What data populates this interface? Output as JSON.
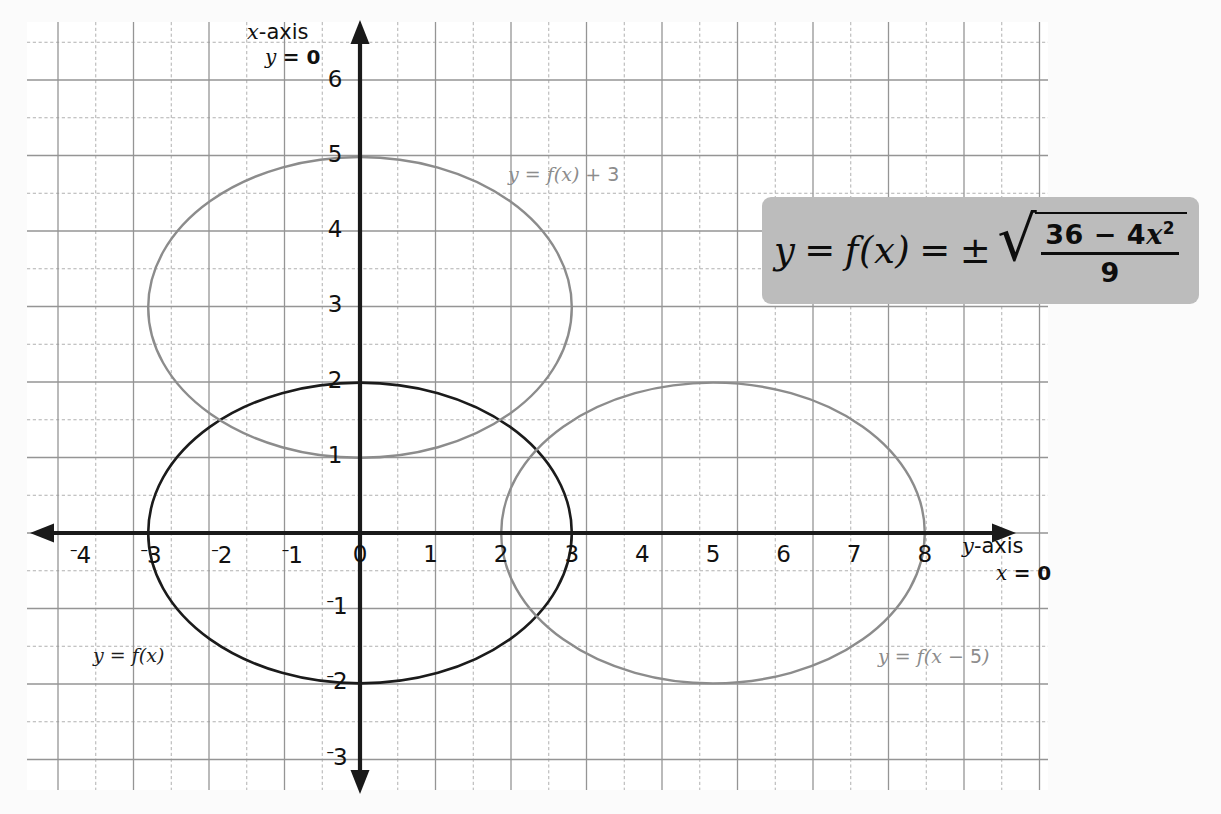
{
  "figure": {
    "background_color": "#fbfbfb",
    "grid": {
      "major_color": "#9a9a9a",
      "minor_color": "#b4b4b4",
      "left": 27,
      "top": 22,
      "right": 1048,
      "bottom": 790,
      "major_step": 75.5
    },
    "axes": {
      "origin_px": [
        360,
        533
      ],
      "unit_x_px": 70.6,
      "unit_y_px": 75.2,
      "color": "#1a1a1a",
      "vertical_label": "x-axis",
      "vertical_label_equation": "y = 0",
      "horizontal_label": "y-axis",
      "horizontal_label_equation": "x = 0"
    },
    "equation_box": {
      "fill": "#bcbcbc",
      "lhs": "y = f(x) = ±",
      "y": "y",
      "eq1": "=",
      "f": "f",
      "paren_open": "(",
      "x": "x",
      "paren_close": ")",
      "eq2": "=",
      "plusminus": "±",
      "radical": "√",
      "numerator_prefix": "36 − 4",
      "numerator_var": "x",
      "numerator_exp": "2",
      "denominator": "9",
      "plain": "y = f(x) = ± √((36 − 4x²)/9)"
    },
    "tick_labels": {
      "x": [
        "-4",
        "-3",
        "-2",
        "-1",
        "0",
        "1",
        "2",
        "3",
        "4",
        "5",
        "6",
        "7",
        "8"
      ],
      "y": [
        "-3",
        "-2",
        "-1",
        "1",
        "2",
        "3",
        "4",
        "5",
        "6"
      ]
    },
    "curve_labels": [
      {
        "name": "f-shifted-up",
        "text_a": "y",
        "text_b": "= f(",
        "text_c": "x",
        "text_d": ") + ",
        "text_e": "3",
        "full": "y = f(x) + 3",
        "color": "#8c8c8c"
      },
      {
        "name": "f-base",
        "full": "y = f(x)",
        "color": "#1b1b1b"
      },
      {
        "name": "f-shifted-right",
        "full": "y = f(x − 5)",
        "color": "#8c8c8c"
      }
    ]
  },
  "chart_data": {
    "type": "line",
    "title": "",
    "xlabel": "y-axis  (x = 0)",
    "ylabel": "x-axis  (y = 0)",
    "xlim": [
      -4.7,
      9.7
    ],
    "ylim": [
      -3.6,
      6.8
    ],
    "xticks": [
      -4,
      -3,
      -2,
      -1,
      0,
      1,
      2,
      3,
      4,
      5,
      6,
      7,
      8
    ],
    "yticks": [
      -3,
      -2,
      -1,
      1,
      2,
      3,
      4,
      5,
      6
    ],
    "grid": true,
    "grid_minor": true,
    "legend": "inline-labels",
    "equation": "y = f(x) = ± sqrt((36 - 4x^2)/9)",
    "series": [
      {
        "name": "y = f(x)",
        "type": "ellipse",
        "center": [
          0,
          0
        ],
        "rx": 3,
        "ry": 2,
        "color": "#1b1b1b",
        "linewidth": 2.6,
        "label_at": [
          -2.65,
          -1.75
        ]
      },
      {
        "name": "y = f(x) + 3",
        "type": "ellipse",
        "center": [
          0,
          3
        ],
        "rx": 3,
        "ry": 2,
        "color": "#8c8c8c",
        "linewidth": 2.4,
        "label_at": [
          2.2,
          4.75
        ]
      },
      {
        "name": "y = f(x - 5)",
        "type": "ellipse",
        "center": [
          5,
          0
        ],
        "rx": 3,
        "ry": 2,
        "color": "#8c8c8c",
        "linewidth": 2.4,
        "label_at": [
          7.4,
          -1.75
        ]
      }
    ]
  }
}
